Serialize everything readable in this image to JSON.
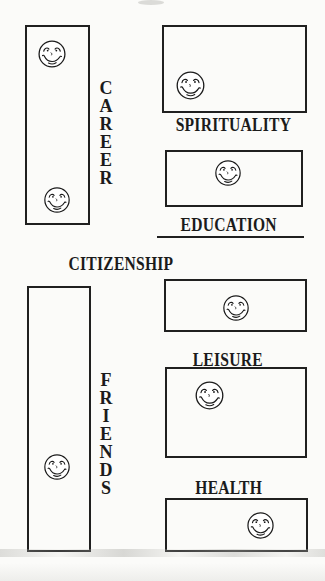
{
  "colors": {
    "ink": "#1b1b1b",
    "paper": "#fbfbf9",
    "line": "#202020"
  },
  "icons": {
    "face": "smiley-face-icon"
  },
  "areas": {
    "career": {
      "label": "CAREER",
      "orientation": "vertical",
      "smiley_count": 2
    },
    "spirituality": {
      "label": "SPIRITUALITY",
      "orientation": "horizontal",
      "smiley_count": 1
    },
    "education": {
      "label": "EDUCATION",
      "orientation": "horizontal",
      "underlined": true,
      "smiley_count": 1
    },
    "citizenship": {
      "label": "CITIZENSHIP",
      "orientation": "horizontal",
      "smiley_count": 0
    },
    "leisure": {
      "label": "LEISURE",
      "orientation": "horizontal",
      "smiley_count": 2
    },
    "friends": {
      "label": "FRIENDS",
      "orientation": "vertical",
      "smiley_count": 1
    },
    "health": {
      "label": "HEALTH",
      "orientation": "horizontal",
      "smiley_count": 1
    }
  }
}
